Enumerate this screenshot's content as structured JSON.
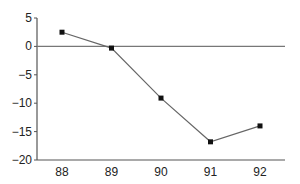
{
  "chart_data": {
    "type": "line",
    "title": "",
    "xlabel": "",
    "ylabel": "",
    "categories": [
      "88",
      "89",
      "90",
      "91",
      "92"
    ],
    "series": [
      {
        "name": "series-1",
        "values": [
          2.5,
          -0.3,
          -9.1,
          -16.8,
          -14.0
        ]
      }
    ],
    "yticks": [
      5,
      0,
      -5,
      -10,
      -15,
      -20
    ],
    "ytick_labels": [
      "5",
      "0",
      "−5",
      "−10",
      "−15",
      "−20"
    ],
    "ylim": [
      -20,
      5
    ],
    "grid": false,
    "legend": null,
    "zero_line": true,
    "marker": "square",
    "colors": {
      "line": "#666666",
      "marker": "#111111",
      "axis": "#555555",
      "zero_line": "#777777"
    }
  }
}
